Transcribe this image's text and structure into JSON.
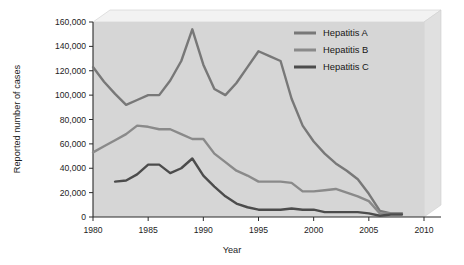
{
  "chart_data": {
    "type": "line",
    "title": "",
    "xlabel": "Year",
    "ylabel": "Reported number of cases",
    "xlim": [
      1980,
      2010
    ],
    "ylim": [
      0,
      160000
    ],
    "xticks": [
      "1980",
      "1985",
      "1990",
      "1995",
      "2000",
      "2005",
      "2010"
    ],
    "xtick_values": [
      1980,
      1985,
      1990,
      1995,
      2000,
      2005,
      2010
    ],
    "yticks": [
      "0",
      "20,000",
      "40,000",
      "60,000",
      "80,000",
      "100,000",
      "120,000",
      "140,000",
      "160,000"
    ],
    "ytick_values": [
      0,
      20000,
      40000,
      60000,
      80000,
      100000,
      120000,
      140000,
      160000
    ],
    "grid": false,
    "legend_position": "top-right",
    "plot_background": "#d4d4d4",
    "series": [
      {
        "name": "Hepatitis A",
        "color": "#787878",
        "x": [
          1980,
          1981,
          1982,
          1983,
          1984,
          1985,
          1986,
          1987,
          1988,
          1989,
          1990,
          1991,
          1992,
          1993,
          1994,
          1995,
          1996,
          1997,
          1998,
          1999,
          2000,
          2001,
          2002,
          2003,
          2004,
          2005,
          2006,
          2007,
          2008
        ],
        "values": [
          123000,
          111000,
          101000,
          92000,
          96000,
          100000,
          100000,
          112000,
          128000,
          154000,
          125000,
          105000,
          100000,
          110000,
          123000,
          136000,
          132000,
          128000,
          97000,
          75000,
          62000,
          52000,
          44000,
          38000,
          31000,
          19000,
          5000,
          3000,
          3000
        ]
      },
      {
        "name": "Hepatitis B",
        "color": "#8a8a8a",
        "x": [
          1980,
          1981,
          1982,
          1983,
          1984,
          1985,
          1986,
          1987,
          1988,
          1989,
          1990,
          1991,
          1992,
          1993,
          1994,
          1995,
          1996,
          1997,
          1998,
          1999,
          2000,
          2001,
          2002,
          2003,
          2004,
          2005,
          2006,
          2007,
          2008
        ],
        "values": [
          53000,
          58000,
          63000,
          68000,
          75000,
          74000,
          72000,
          72000,
          68000,
          64000,
          64000,
          52000,
          45000,
          38000,
          34000,
          29000,
          29000,
          29000,
          28000,
          21000,
          21000,
          22000,
          23000,
          20000,
          17000,
          13000,
          3000,
          3000,
          3000
        ]
      },
      {
        "name": "Hepatitis C",
        "color": "#4c4c4c",
        "x": [
          1982,
          1983,
          1984,
          1985,
          1986,
          1987,
          1988,
          1989,
          1990,
          1991,
          1992,
          1993,
          1994,
          1995,
          1996,
          1997,
          1998,
          1999,
          2000,
          2001,
          2002,
          2003,
          2004,
          2005,
          2006,
          2007,
          2008
        ],
        "values": [
          29000,
          30000,
          35000,
          43000,
          43000,
          36000,
          40000,
          48000,
          34000,
          25000,
          17000,
          11000,
          8000,
          6000,
          6000,
          6000,
          7000,
          6000,
          6000,
          4000,
          4000,
          4000,
          4000,
          3000,
          1000,
          2000,
          2000
        ]
      }
    ],
    "annotations": []
  },
  "legend": {
    "entries": [
      {
        "label": "Hepatitis A"
      },
      {
        "label": "Hepatitis B"
      },
      {
        "label": "Hepatitis C"
      }
    ]
  }
}
